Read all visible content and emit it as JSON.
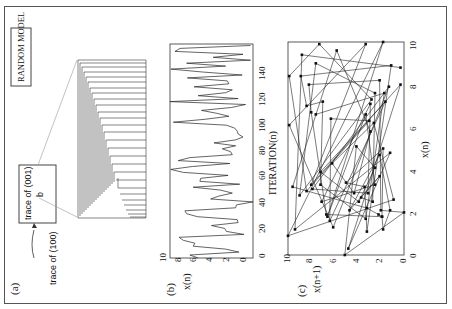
{
  "figure": {
    "rotation_deg": -90,
    "panels": {
      "a": {
        "label": "(a)",
        "title_box": "RANDOM MODEL",
        "inset_text": "trace of (001)",
        "inset_point": "b",
        "arrow_text": "trace of (100)"
      },
      "b": {
        "label": "(b)",
        "xlabel": "ITERATION(n)",
        "ylabel": "x(n)",
        "xticks": [
          "0",
          "20",
          "40",
          "60",
          "80",
          "100",
          "120",
          "140"
        ],
        "yticks": [
          "0",
          "2",
          "4",
          "6",
          "8",
          "10"
        ]
      },
      "c": {
        "label": "(c)",
        "xlabel": "x(n)",
        "ylabel": "x(n+1)",
        "xticks": [
          "0",
          "2",
          "4",
          "6",
          "8",
          "10"
        ],
        "yticks": [
          "0",
          "2",
          "4",
          "6",
          "8",
          "10"
        ]
      }
    }
  },
  "chart_data": [
    {
      "type": "line",
      "title": "(b) time series",
      "xlabel": "ITERATION(n)",
      "ylabel": "x(n)",
      "xlim": [
        0,
        145
      ],
      "ylim": [
        0,
        10
      ],
      "x": [
        0,
        2,
        4,
        6,
        8,
        10,
        12,
        14,
        16,
        18,
        20,
        22,
        24,
        26,
        28,
        30,
        32,
        34,
        36,
        38,
        40,
        42,
        44,
        46,
        48,
        50,
        52,
        54,
        56,
        58,
        60,
        62,
        64,
        66,
        68,
        70,
        72,
        74,
        76,
        78,
        80,
        82,
        84,
        86,
        88,
        90,
        92,
        94,
        96,
        98,
        100,
        102,
        104,
        106,
        108,
        110,
        112,
        114,
        116,
        118,
        120,
        122,
        124,
        126,
        128,
        130,
        132,
        134,
        136,
        138,
        140,
        142,
        144
      ],
      "values": [
        6.6,
        7.6,
        1.7,
        3.3,
        7.2,
        7.0,
        8.4,
        8.9,
        1.1,
        3.2,
        3.4,
        5.0,
        1.8,
        1.9,
        6.7,
        8.0,
        8.2,
        2.1,
        2.0,
        0.0,
        5.1,
        4.1,
        2.5,
        3.9,
        7.2,
        1.6,
        6.4,
        6.3,
        3.0,
        8.4,
        9.9,
        7.3,
        2.8,
        9.0,
        7.6,
        2.5,
        2.7,
        3.7,
        2.1,
        4.7,
        2.1,
        1.2,
        1.8,
        1.9,
        2.2,
        3.2,
        9.6,
        5.8,
        2.9,
        4.3,
        6.2,
        2.6,
        0.9,
        10.0,
        1.8,
        6.6,
        3.3,
        2.5,
        7.1,
        2.9,
        3.1,
        7.9,
        1.3,
        6.1,
        9.9,
        3.3,
        8.0,
        0.3,
        4.8,
        1.2,
        9.4,
        8.8,
        0.3
      ],
      "grid": false
    },
    {
      "type": "scatter",
      "title": "(c) return map",
      "xlabel": "x(n)",
      "ylabel": "x(n+1)",
      "xlim": [
        0,
        10
      ],
      "ylim": [
        0,
        10
      ],
      "connected": true,
      "grid": false
    }
  ]
}
